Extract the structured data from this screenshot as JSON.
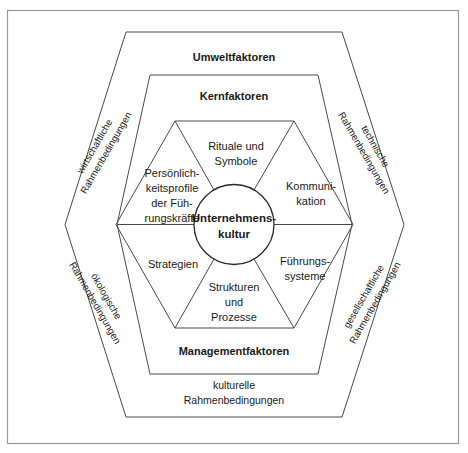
{
  "figure": {
    "type": "concentric-hexagon-diagram",
    "language": "de"
  },
  "frame": {
    "border_color": "#9a9a9a",
    "background": "#ffffff"
  },
  "colors": {
    "line": "#4a4a4a",
    "circle_line": "#2a2a2a",
    "text": "#1a1a1a",
    "background": "#ffffff"
  },
  "rings": {
    "outer": {
      "name": "Umweltfaktoren",
      "label_top": "Umweltfaktoren",
      "label_bottom_line1": "kulturelle",
      "label_bottom_line2": "Rahmenbedingungen",
      "diagonal_labels": [
        {
          "id": "upper-left",
          "line1": "wirtschaftliche",
          "line2": "Rahmenbedingungen",
          "rotation_deg": -60
        },
        {
          "id": "upper-right",
          "line1": "technische",
          "line2": "Rahmenbedingungen",
          "rotation_deg": 60
        },
        {
          "id": "lower-left",
          "line1": "ökologische",
          "line2": "Rahmenbedingungen",
          "rotation_deg": 60
        },
        {
          "id": "lower-right",
          "line1": "gesellschaftliche",
          "line2": "Rahmenbedingungen",
          "rotation_deg": -60
        }
      ]
    },
    "middle": {
      "name": "Kernfaktoren",
      "label_top": "Kernfaktoren",
      "label_bottom": "Managementfaktoren"
    },
    "inner": {
      "name": "Kernfaktoren-Segmente",
      "segments": [
        {
          "id": "top",
          "lines": [
            "Rituale und",
            "Symbole"
          ]
        },
        {
          "id": "upper-right",
          "lines": [
            "Kommuni-",
            "kation"
          ]
        },
        {
          "id": "lower-right",
          "lines": [
            "Führungs-",
            "systeme"
          ]
        },
        {
          "id": "bottom",
          "lines": [
            "Strukturen",
            "und",
            "Prozesse"
          ]
        },
        {
          "id": "lower-left",
          "lines": [
            "Strategien"
          ]
        },
        {
          "id": "upper-left",
          "lines": [
            "Persönlich-",
            "keitsprofile",
            "der Füh-",
            "rungskräfte"
          ]
        }
      ]
    },
    "core": {
      "name": "Unternehmenskultur",
      "lines": [
        "Unternehmens-",
        "kultur"
      ]
    }
  }
}
